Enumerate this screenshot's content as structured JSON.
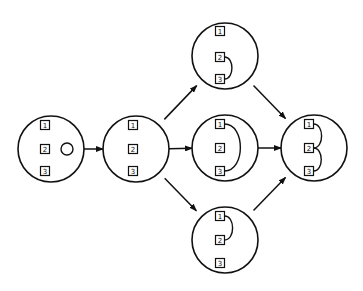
{
  "diagram": {
    "nodes": [
      {
        "id": "start",
        "cx": 51,
        "cy": 149,
        "r": 33,
        "box_x": 45,
        "box_y": [
          125,
          149,
          171
        ],
        "labels": [
          "1",
          "2",
          "3"
        ],
        "extra_circle": {
          "cx": 67,
          "cy": 149,
          "r": 6
        },
        "arcs": []
      },
      {
        "id": "three-boxes",
        "cx": 136,
        "cy": 149,
        "r": 33,
        "box_x": 133,
        "box_y": [
          125,
          149,
          171
        ],
        "labels": [
          "1",
          "2",
          "3"
        ],
        "arcs": []
      },
      {
        "id": "pair-2-3",
        "cx": 225,
        "cy": 56,
        "r": 33,
        "box_x": 220,
        "box_y": [
          31,
          57,
          79
        ],
        "labels": [
          "1",
          "2",
          "3"
        ],
        "arcs": [
          [
            1,
            2
          ]
        ]
      },
      {
        "id": "pair-1-3",
        "cx": 225,
        "cy": 148,
        "r": 33,
        "box_x": 220,
        "box_y": [
          124,
          148,
          171
        ],
        "labels": [
          "1",
          "2",
          "3"
        ],
        "arcs": [
          [
            0,
            2
          ]
        ]
      },
      {
        "id": "pair-1-2",
        "cx": 225,
        "cy": 240,
        "r": 33,
        "box_x": 220,
        "box_y": [
          216,
          240,
          263
        ],
        "labels": [
          "1",
          "2",
          "3"
        ],
        "arcs": [
          [
            0,
            1
          ]
        ]
      },
      {
        "id": "all-joined",
        "cx": 314,
        "cy": 148,
        "r": 33,
        "box_x": 309,
        "box_y": [
          124,
          148,
          171
        ],
        "labels": [
          "1",
          "2",
          "3"
        ],
        "arcs": [
          [
            0,
            1
          ],
          [
            1,
            2
          ]
        ]
      }
    ],
    "edges": [
      {
        "from": "start",
        "to": "three-boxes"
      },
      {
        "from": "three-boxes",
        "to": "pair-2-3"
      },
      {
        "from": "three-boxes",
        "to": "pair-1-3"
      },
      {
        "from": "three-boxes",
        "to": "pair-1-2"
      },
      {
        "from": "pair-2-3",
        "to": "all-joined"
      },
      {
        "from": "pair-1-3",
        "to": "all-joined"
      },
      {
        "from": "pair-1-2",
        "to": "all-joined"
      }
    ],
    "stroke_color": "#111111",
    "background": "#ffffff"
  }
}
